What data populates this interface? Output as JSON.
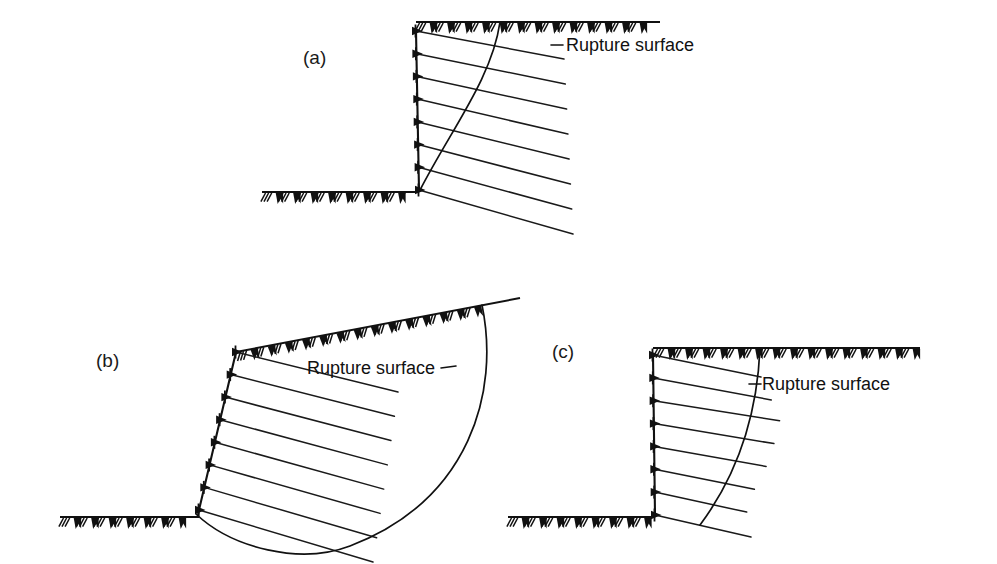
{
  "figure": {
    "title_visible": false,
    "background_color": "#ffffff",
    "ink_color": "#111111",
    "width": 997,
    "height": 564
  },
  "panels": [
    {
      "id": "a",
      "label": "(a)",
      "label_pos": {
        "x": 303,
        "y": 64
      },
      "annotation": {
        "text": "Rupture surface",
        "pos": {
          "x": 566,
          "y": 51
        },
        "leader": "dash-left"
      },
      "wall": {
        "type": "vertical",
        "crest": {
          "x": 416,
          "y": 31
        },
        "toe": {
          "x": 419,
          "y": 190
        },
        "height_px": 159
      },
      "crest_ground": {
        "x1": 416,
        "y1": 22,
        "x2": 660,
        "y2": 22
      },
      "toe_ground": {
        "x1": 262,
        "y1": 192,
        "x2": 419,
        "y2": 192
      },
      "reinforcement_layers": 8,
      "rupture": {
        "shape": "gentle-curve",
        "top": {
          "x": 500,
          "y": 22
        },
        "bottom": {
          "x": 420,
          "y": 190
        }
      }
    },
    {
      "id": "b",
      "label": "(b)",
      "label_pos": {
        "x": 96,
        "y": 367
      },
      "annotation": {
        "text": "Rupture surface",
        "pos": {
          "x": 307,
          "y": 374
        },
        "leader": "dash-right"
      },
      "wall": {
        "type": "battered",
        "crest": {
          "x": 236,
          "y": 352
        },
        "toe": {
          "x": 199,
          "y": 510
        },
        "height_px": 158
      },
      "crest_ground": {
        "x1": 236,
        "y1": 352,
        "x2": 482,
        "y2": 305
      },
      "toe_ground": {
        "x1": 60,
        "y1": 517,
        "x2": 199,
        "y2": 517
      },
      "reinforcement_layers": 8,
      "rupture": {
        "shape": "deep-seated-circular",
        "top": {
          "x": 482,
          "y": 305
        },
        "lowest": {
          "x": 312,
          "y": 553
        },
        "exit": {
          "x": 196,
          "y": 514
        }
      }
    },
    {
      "id": "c",
      "label": "(c)",
      "label_pos": {
        "x": 552,
        "y": 358
      },
      "annotation": {
        "text": "Rupture surface",
        "pos": {
          "x": 762,
          "y": 390
        },
        "leader": "dash-left"
      },
      "wall": {
        "type": "vertical",
        "crest": {
          "x": 653,
          "y": 355
        },
        "toe": {
          "x": 655,
          "y": 515
        },
        "height_px": 160
      },
      "crest_ground": {
        "x1": 653,
        "y1": 348,
        "x2": 920,
        "y2": 348
      },
      "toe_ground": {
        "x1": 508,
        "y1": 517,
        "x2": 655,
        "y2": 517
      },
      "reinforcement_layers": 8,
      "rupture": {
        "shape": "compound-curve",
        "top": {
          "x": 760,
          "y": 348
        },
        "bottom": {
          "x": 700,
          "y": 525
        }
      }
    }
  ],
  "legend_terms": {
    "rupture_surface": "Rupture surface",
    "ground_symbol": "natural-ground-hatch",
    "reinforcement": "reinforcement-layer",
    "facing_connection": "facing-connection-node"
  }
}
